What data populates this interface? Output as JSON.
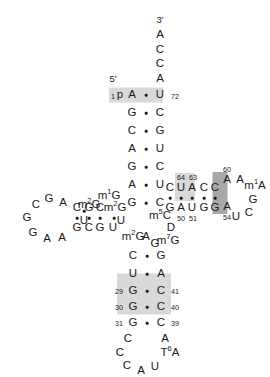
{
  "figure": {
    "type": "trna-cloverleaf-secondary-structure",
    "end_labels": [
      {
        "name": "five-prime-label",
        "text": "5'",
        "x": 113,
        "y": 79
      },
      {
        "name": "three-prime-label",
        "text": "3'",
        "x": 160,
        "y": 20
      }
    ],
    "shades": [
      {
        "name": "acceptor-stem-shade-top",
        "x": 136,
        "y": 95,
        "w": 54,
        "h": 15,
        "tone": "light"
      },
      {
        "name": "t-stem-shade",
        "x": 185,
        "y": 187,
        "w": 20,
        "h": 28,
        "tone": "light"
      },
      {
        "name": "t-loop-shade-dark",
        "x": 220,
        "y": 193,
        "w": 15,
        "h": 42,
        "tone": "dark"
      },
      {
        "name": "anticodon-stem-shade",
        "x": 144,
        "y": 294,
        "w": 54,
        "h": 41,
        "tone": "light"
      }
    ],
    "acceptor_arm": {
      "three_prime_tail": [
        {
          "name": "nt-A76",
          "base": "A",
          "x": 160,
          "y": 35
        },
        {
          "name": "nt-C75",
          "base": "C",
          "x": 160,
          "y": 50
        },
        {
          "name": "nt-C74",
          "base": "C",
          "x": 160,
          "y": 64
        },
        {
          "name": "nt-A73",
          "base": "A",
          "x": 160,
          "y": 79
        }
      ],
      "five_prime_marker": {
        "name": "nt-p-phosphate",
        "base": "p",
        "x": 120,
        "y": 95
      },
      "left_strand": [
        {
          "name": "nt-A1",
          "base": "A",
          "x": 132,
          "y": 95
        },
        {
          "name": "nt-G2",
          "base": "G",
          "x": 132,
          "y": 113
        },
        {
          "name": "nt-C3",
          "base": "C",
          "x": 132,
          "y": 131
        },
        {
          "name": "nt-A4",
          "base": "A",
          "x": 132,
          "y": 149
        },
        {
          "name": "nt-G5",
          "base": "G",
          "x": 132,
          "y": 167
        },
        {
          "name": "nt-A6",
          "base": "A",
          "x": 132,
          "y": 185
        },
        {
          "name": "nt-G7",
          "base": "G",
          "x": 132,
          "y": 203
        },
        {
          "name": "nt-U8",
          "base": "U",
          "x": 121,
          "y": 221
        }
      ],
      "right_strand": [
        {
          "name": "nt-U72",
          "base": "U",
          "x": 160,
          "y": 95
        },
        {
          "name": "nt-C71",
          "base": "C",
          "x": 160,
          "y": 113
        },
        {
          "name": "nt-G70",
          "base": "G",
          "x": 160,
          "y": 131
        },
        {
          "name": "nt-U69",
          "base": "U",
          "x": 160,
          "y": 149
        },
        {
          "name": "nt-C68",
          "base": "C",
          "x": 160,
          "y": 167
        },
        {
          "name": "nt-U67",
          "base": "U",
          "x": 160,
          "y": 185
        },
        {
          "name": "nt-C66",
          "base": "C",
          "x": 160,
          "y": 203
        }
      ],
      "pair_dots": [
        {
          "name": "pair-dot-1-72",
          "x": 146,
          "y": 95
        },
        {
          "name": "pair-dot-2-71",
          "x": 146,
          "y": 113
        },
        {
          "name": "pair-dot-3-70",
          "x": 146,
          "y": 131
        },
        {
          "name": "pair-dot-4-69",
          "x": 146,
          "y": 149
        },
        {
          "name": "pair-dot-5-68",
          "x": 146,
          "y": 167
        },
        {
          "name": "pair-dot-6-67",
          "x": 146,
          "y": 185
        },
        {
          "name": "pair-dot-7-66",
          "x": 146,
          "y": 203
        }
      ],
      "numbers": [
        {
          "name": "index-1",
          "text": "1",
          "x": 113,
          "y": 97
        },
        {
          "name": "index-72",
          "text": "72",
          "x": 175,
          "y": 97
        }
      ]
    },
    "t_arm": {
      "top_strand": [
        {
          "name": "nt-C65",
          "base": "C",
          "x": 170,
          "y": 188
        },
        {
          "name": "nt-U64",
          "base": "U",
          "x": 181,
          "y": 188
        },
        {
          "name": "nt-A63",
          "base": "A",
          "x": 192,
          "y": 188
        },
        {
          "name": "nt-C62",
          "base": "C",
          "x": 204,
          "y": 188
        },
        {
          "name": "nt-C61",
          "base": "C",
          "x": 215,
          "y": 188
        }
      ],
      "bottom_strand": [
        {
          "name": "nt-G49",
          "base": "G",
          "x": 170,
          "y": 208
        },
        {
          "name": "nt-A50",
          "base": "A",
          "x": 181,
          "y": 208
        },
        {
          "name": "nt-U51",
          "base": "U",
          "x": 192,
          "y": 208
        },
        {
          "name": "nt-G52",
          "base": "G",
          "x": 204,
          "y": 208
        },
        {
          "name": "nt-G53",
          "base": "G",
          "x": 215,
          "y": 208
        }
      ],
      "pair_dots": [
        {
          "name": "pair-dot-49-65",
          "x": 170,
          "y": 198
        },
        {
          "name": "pair-dot-50-64",
          "x": 181,
          "y": 198
        },
        {
          "name": "pair-dot-51-63",
          "x": 192,
          "y": 198
        },
        {
          "name": "pair-dot-52-62",
          "x": 204,
          "y": 198
        },
        {
          "name": "pair-dot-53-61",
          "x": 215,
          "y": 198
        }
      ],
      "loop": [
        {
          "name": "nt-A60",
          "base": "A",
          "x": 227,
          "y": 180
        },
        {
          "name": "nt-A59",
          "base": "A",
          "x": 240,
          "y": 180
        },
        {
          "name": "nt-m1A58",
          "base": "m",
          "sup": "1",
          "base2": "A",
          "x": 255,
          "y": 186
        },
        {
          "name": "nt-G57",
          "base": "G",
          "x": 253,
          "y": 200
        },
        {
          "name": "nt-C56",
          "base": "C",
          "x": 249,
          "y": 213
        },
        {
          "name": "nt-U55",
          "base": "U",
          "x": 236,
          "y": 217
        },
        {
          "name": "nt-T54",
          "base": "A",
          "x": 227,
          "y": 207
        }
      ],
      "numbers": [
        {
          "name": "index-64",
          "text": "64",
          "x": 181,
          "y": 178
        },
        {
          "name": "index-63",
          "text": "63",
          "x": 193,
          "y": 178
        },
        {
          "name": "index-50",
          "text": "50",
          "x": 181,
          "y": 219
        },
        {
          "name": "index-51",
          "text": "51",
          "x": 193,
          "y": 219
        },
        {
          "name": "index-60",
          "text": "60",
          "x": 227,
          "y": 170
        },
        {
          "name": "index-54",
          "text": "54",
          "x": 227,
          "y": 218
        }
      ],
      "m5c": {
        "name": "nt-m5C48",
        "base": "m",
        "sup": "5",
        "base2": "C",
        "x": 160,
        "y": 216
      }
    },
    "variable_loop": [
      {
        "name": "nt-D47",
        "base": "D",
        "x": 171,
        "y": 228
      },
      {
        "name": "nt-m7G46",
        "base": "m",
        "sup": "7",
        "base2": "G",
        "x": 168,
        "y": 241
      },
      {
        "name": "nt-G45",
        "base": "G",
        "x": 155,
        "y": 244
      },
      {
        "name": "nt-A44",
        "base": "A",
        "x": 146,
        "y": 237
      }
    ],
    "d_arm": {
      "top_strand": [
        {
          "name": "nt-C11",
          "base": "C",
          "x": 77,
          "y": 208
        },
        {
          "name": "nt-G12",
          "base": "G",
          "x": 89,
          "y": 208
        },
        {
          "name": "nt-C13",
          "base": "C",
          "x": 100,
          "y": 208
        },
        {
          "name": "nt-m2G14",
          "base": "m",
          "sup": "2",
          "base2": "G",
          "x": 115,
          "y": 208
        }
      ],
      "bottom_strand": [
        {
          "name": "nt-G23",
          "base": "G",
          "x": 77,
          "y": 228
        },
        {
          "name": "nt-C24",
          "base": "C",
          "x": 89,
          "y": 228
        },
        {
          "name": "nt-G25",
          "base": "G",
          "x": 100,
          "y": 228
        },
        {
          "name": "nt-U26",
          "base": "U",
          "x": 113,
          "y": 228
        }
      ],
      "pair_dots": [
        {
          "name": "pair-dot-11-24",
          "x": 77,
          "y": 218
        },
        {
          "name": "pair-dot-12-23",
          "x": 89,
          "y": 218
        },
        {
          "name": "pair-dot-13-22",
          "x": 100,
          "y": 218
        },
        {
          "name": "pair-dot-14-21",
          "x": 114,
          "y": 218
        }
      ],
      "loop": [
        {
          "name": "nt-A16",
          "base": "A",
          "x": 63,
          "y": 203
        },
        {
          "name": "nt-G17",
          "base": "G",
          "x": 49,
          "y": 199
        },
        {
          "name": "nt-C18",
          "base": "C",
          "x": 36,
          "y": 205
        },
        {
          "name": "nt-G19",
          "base": "G",
          "x": 27,
          "y": 218
        },
        {
          "name": "nt-G20",
          "base": "G",
          "x": 33,
          "y": 233
        },
        {
          "name": "nt-A21",
          "base": "A",
          "x": 47,
          "y": 239
        },
        {
          "name": "nt-A22",
          "base": "A",
          "x": 62,
          "y": 238
        }
      ],
      "m1g": {
        "name": "nt-m1G10",
        "base": "m",
        "sup": "1",
        "base2": "G",
        "x": 109,
        "y": 196
      },
      "m2g_left": {
        "name": "nt-m2G9",
        "base": "m",
        "sup": "2",
        "base2": "G",
        "x": 89,
        "y": 205
      },
      "m2g_lower": {
        "name": "nt-m2G27",
        "base": "m",
        "sup": "2",
        "base2": "G",
        "x": 133,
        "y": 237
      },
      "connectors": [
        {
          "name": "nt-U9",
          "base": "U",
          "x": 84,
          "y": 221
        },
        {
          "name": "pair-dot-9",
          "x": 84,
          "y": 211
        }
      ]
    },
    "anticodon_arm": {
      "left_strand": [
        {
          "name": "nt-C27",
          "base": "C",
          "x": 133,
          "y": 256
        },
        {
          "name": "nt-U28",
          "base": "U",
          "x": 133,
          "y": 274
        },
        {
          "name": "nt-G29",
          "base": "G",
          "x": 133,
          "y": 291
        },
        {
          "name": "nt-G30",
          "base": "G",
          "x": 133,
          "y": 307
        },
        {
          "name": "nt-G31",
          "base": "G",
          "x": 133,
          "y": 323
        }
      ],
      "right_strand": [
        {
          "name": "nt-G43",
          "base": "G",
          "x": 161,
          "y": 256
        },
        {
          "name": "nt-A42",
          "base": "A",
          "x": 161,
          "y": 274
        },
        {
          "name": "nt-C41",
          "base": "C",
          "x": 161,
          "y": 291
        },
        {
          "name": "nt-C40",
          "base": "C",
          "x": 161,
          "y": 307
        },
        {
          "name": "nt-C39",
          "base": "C",
          "x": 161,
          "y": 323
        }
      ],
      "pair_dots": [
        {
          "name": "pair-dot-27-43",
          "x": 147,
          "y": 256
        },
        {
          "name": "pair-dot-28-42",
          "x": 147,
          "y": 274
        },
        {
          "name": "pair-dot-29-41",
          "x": 147,
          "y": 291
        },
        {
          "name": "pair-dot-30-40",
          "x": 147,
          "y": 307
        },
        {
          "name": "pair-dot-31-39",
          "x": 147,
          "y": 323
        }
      ],
      "numbers": [
        {
          "name": "index-29",
          "text": "29",
          "x": 119,
          "y": 292
        },
        {
          "name": "index-30",
          "text": "30",
          "x": 119,
          "y": 308
        },
        {
          "name": "index-31",
          "text": "31",
          "x": 119,
          "y": 324
        },
        {
          "name": "index-41",
          "text": "41",
          "x": 175,
          "y": 292
        },
        {
          "name": "index-40",
          "text": "40",
          "x": 175,
          "y": 308
        },
        {
          "name": "index-39",
          "text": "39",
          "x": 175,
          "y": 324
        }
      ],
      "loop": [
        {
          "name": "nt-C32",
          "base": "C",
          "x": 128,
          "y": 339
        },
        {
          "name": "nt-C33",
          "base": "C",
          "x": 120,
          "y": 353
        },
        {
          "name": "nt-C34",
          "base": "C",
          "x": 127,
          "y": 366
        },
        {
          "name": "nt-A35",
          "base": "A",
          "x": 141,
          "y": 371
        },
        {
          "name": "nt-U36",
          "base": "U",
          "x": 155,
          "y": 367
        },
        {
          "name": "nt-t6A37",
          "base": "T",
          "sup": "6",
          "base2": "A",
          "x": 170,
          "y": 353
        },
        {
          "name": "nt-A38",
          "base": "A",
          "x": 165,
          "y": 339
        }
      ]
    }
  }
}
